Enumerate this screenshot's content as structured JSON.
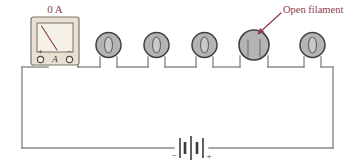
{
  "figure": {
    "background_color": "#ffffff"
  },
  "colors": {
    "wire": "#8a8a8a",
    "annotation_red": "#8e3b4e",
    "meter_body": "#e8e0d2",
    "meter_border": "#7d7468",
    "meter_face": "#f3eee4",
    "bulb_fill": "#b4b4b4",
    "bulb_stroke": "#4a4a4a",
    "filament": "#8c8c8c",
    "battery": "#3a3a3a",
    "needle": "#8e3b4e"
  },
  "meter": {
    "name": "ammeter",
    "reading_label": "0 A",
    "reading_value": 0,
    "reading_unit": "A",
    "scale_symbol": "A",
    "terminals": [
      {
        "name": "positive-terminal",
        "label": "+"
      },
      {
        "name": "scale-label",
        "label": "A"
      },
      {
        "name": "negative-terminal",
        "label": "−"
      }
    ],
    "needle_deflection": "zero"
  },
  "lamps": [
    {
      "index": 1,
      "name": "lamp-1",
      "state": "intact",
      "filament": "closed-loop"
    },
    {
      "index": 2,
      "name": "lamp-2",
      "state": "intact",
      "filament": "closed-loop"
    },
    {
      "index": 3,
      "name": "lamp-3",
      "state": "intact",
      "filament": "closed-loop"
    },
    {
      "index": 4,
      "name": "lamp-4",
      "state": "open",
      "filament": "broken"
    },
    {
      "index": 5,
      "name": "lamp-5",
      "state": "intact",
      "filament": "closed-loop"
    }
  ],
  "annotation": {
    "text": "Open filament",
    "points_to": "lamp-4",
    "arrow": "down-left"
  },
  "battery": {
    "name": "battery",
    "negative_label": "−",
    "positive_label": "+",
    "cells": 2
  }
}
